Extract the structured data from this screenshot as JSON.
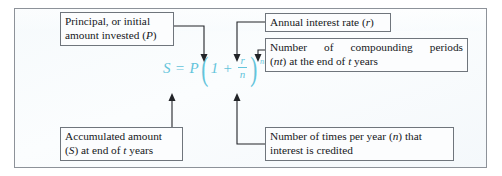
{
  "diagram": {
    "background_color": "#f6fafc",
    "border_color": "#8d9299",
    "formula_color": "#63c4db",
    "label_text_color": "#16181b",
    "formula": {
      "lhs": "S",
      "equals": "=",
      "principal": "P",
      "open_paren": "(",
      "one": "1",
      "plus": "+",
      "numerator": "r",
      "denominator": "n",
      "close_paren": ")",
      "exponent": "nt",
      "plain_text": "S = P(1 + r/n)^(nt)"
    },
    "callouts": [
      {
        "id": "principal",
        "line1": "Principal, or initial",
        "line2": "amount invested (P)",
        "points_to": "P",
        "arrow_direction": "down"
      },
      {
        "id": "annual-interest-rate",
        "line1": "Annual interest rate (r)",
        "line2": "",
        "points_to": "r",
        "arrow_direction": "down"
      },
      {
        "id": "compounding-periods",
        "line1": "Number of compounding periods",
        "line2": "(nt) at the end of t years",
        "points_to": "nt",
        "arrow_direction": "down"
      },
      {
        "id": "accumulated-amount",
        "line1": "Accumulated amount",
        "line2": "(S) at end of t years",
        "points_to": "S",
        "arrow_direction": "up"
      },
      {
        "id": "times-per-year",
        "line1": "Number of times per year (n) that",
        "line2": "interest is credited",
        "points_to": "n",
        "arrow_direction": "up"
      }
    ]
  }
}
